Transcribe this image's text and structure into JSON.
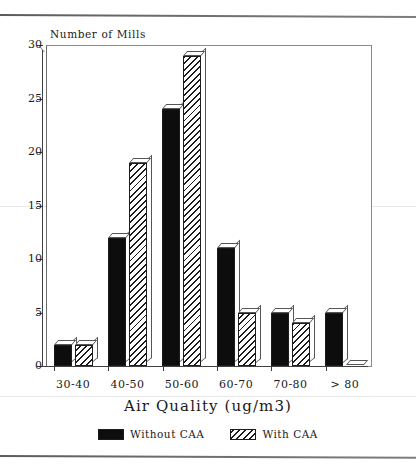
{
  "chart_data": {
    "type": "bar",
    "title": "",
    "xlabel": "Air Quality (ug/m3)",
    "ylabel": "Number of Mills",
    "categories": [
      "30-40",
      "40-50",
      "50-60",
      "60-70",
      "70-80",
      "> 80"
    ],
    "series": [
      {
        "name": "Without CAA",
        "values": [
          2,
          12,
          24,
          11,
          5,
          5
        ],
        "style": "solid",
        "color": "#0d0d0d"
      },
      {
        "name": "With CAA",
        "values": [
          2,
          19,
          29,
          5,
          4,
          0
        ],
        "style": "hatched",
        "color": "#ffffff"
      }
    ],
    "ylim": [
      0,
      30
    ],
    "yticks": [
      0,
      5,
      10,
      15,
      20,
      25,
      30
    ],
    "ytick_labels": [
      "0",
      "5",
      "10",
      "15",
      "20",
      "25",
      "30"
    ],
    "grid": false,
    "legend_position": "bottom",
    "bar_style": "3d-extruded"
  },
  "legend": {
    "items": [
      {
        "label": "Without CAA",
        "swatch": "solid-black-swatch"
      },
      {
        "label": "With CAA",
        "swatch": "diagonal-hatch-swatch"
      }
    ]
  }
}
